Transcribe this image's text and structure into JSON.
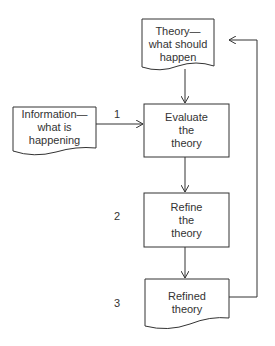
{
  "nodes": {
    "theory": {
      "lines": [
        "Theory—",
        "what should",
        "happen"
      ]
    },
    "information": {
      "lines": [
        "Information—",
        "what is",
        "happening"
      ]
    },
    "evaluate": {
      "lines": [
        "Evaluate",
        "the",
        "theory"
      ]
    },
    "refine": {
      "lines": [
        "Refine",
        "the",
        "theory"
      ]
    },
    "refined": {
      "lines": [
        "Refined",
        "theory"
      ]
    }
  },
  "steps": [
    "1",
    "2",
    "3"
  ],
  "colors": {
    "stroke": "#333333",
    "text": "#333333",
    "background": "#ffffff"
  }
}
